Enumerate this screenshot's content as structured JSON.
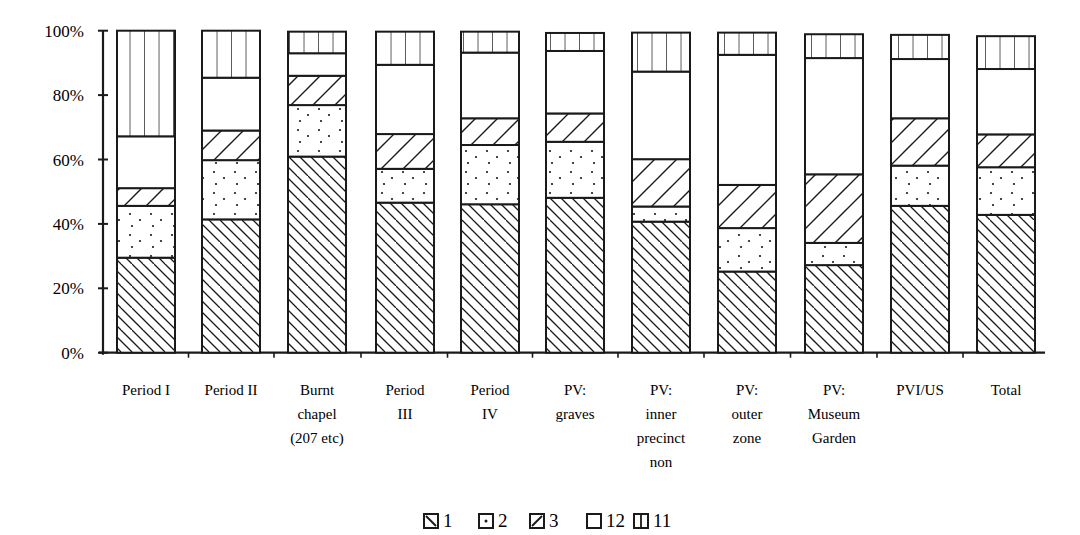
{
  "chart_data": {
    "type": "bar",
    "stacked": true,
    "percent": true,
    "title": "",
    "xlabel": "",
    "ylabel": "",
    "ylim": [
      0,
      100
    ],
    "yticks": [
      "0%",
      "20%",
      "40%",
      "60%",
      "80%",
      "100%"
    ],
    "grid": false,
    "legend_position": "bottom",
    "categories": [
      [
        "Period I"
      ],
      [
        "Period II"
      ],
      [
        "Burnt",
        "chapel",
        "(207 etc)"
      ],
      [
        "Period",
        "III"
      ],
      [
        "Period",
        "IV"
      ],
      [
        "PV:",
        "graves"
      ],
      [
        "PV:",
        "inner",
        "precinct",
        "non"
      ],
      [
        "PV:",
        "outer",
        "zone"
      ],
      [
        "PV:",
        "Museum",
        "Garden"
      ],
      [
        "PVI/US"
      ],
      [
        "Total"
      ]
    ],
    "category_names": [
      "Period I",
      "Period II",
      "Burnt chapel (207 etc)",
      "Period III",
      "Period IV",
      "PV: graves",
      "PV: inner precinct non",
      "PV: outer zone",
      "PV: Museum Garden",
      "PVI/US",
      "Total"
    ],
    "series": [
      {
        "name": "1",
        "pattern": "back-diagonal",
        "values": [
          29.5,
          41.4,
          60.9,
          46.6,
          46.1,
          48.1,
          40.7,
          25.2,
          27.2,
          45.6,
          42.8
        ]
      },
      {
        "name": "2",
        "pattern": "dots",
        "values": [
          16.1,
          18.4,
          16.0,
          10.5,
          18.4,
          17.4,
          4.7,
          13.5,
          6.9,
          12.5,
          14.8
        ]
      },
      {
        "name": "3",
        "pattern": "forward-diagonal",
        "values": [
          5.5,
          9.2,
          9.1,
          10.8,
          8.3,
          8.8,
          14.7,
          13.4,
          21.3,
          14.7,
          10.2
        ]
      },
      {
        "name": "12",
        "pattern": "blank",
        "values": [
          16.1,
          16.4,
          7.0,
          21.5,
          20.4,
          19.4,
          27.2,
          40.4,
          36.1,
          18.4,
          20.3
        ]
      },
      {
        "name": "11",
        "pattern": "vertical",
        "values": [
          32.8,
          14.6,
          6.7,
          10.3,
          6.5,
          5.6,
          12.1,
          6.9,
          7.4,
          7.5,
          10.2
        ]
      }
    ]
  },
  "legend": [
    {
      "label": "1",
      "icon": "back-diagonal-swatch"
    },
    {
      "label": "2",
      "icon": "dot-swatch"
    },
    {
      "label": "3",
      "icon": "forward-diagonal-swatch"
    },
    {
      "label": "12",
      "icon": "blank-swatch"
    },
    {
      "label": "11",
      "icon": "vertical-lines-swatch"
    }
  ]
}
